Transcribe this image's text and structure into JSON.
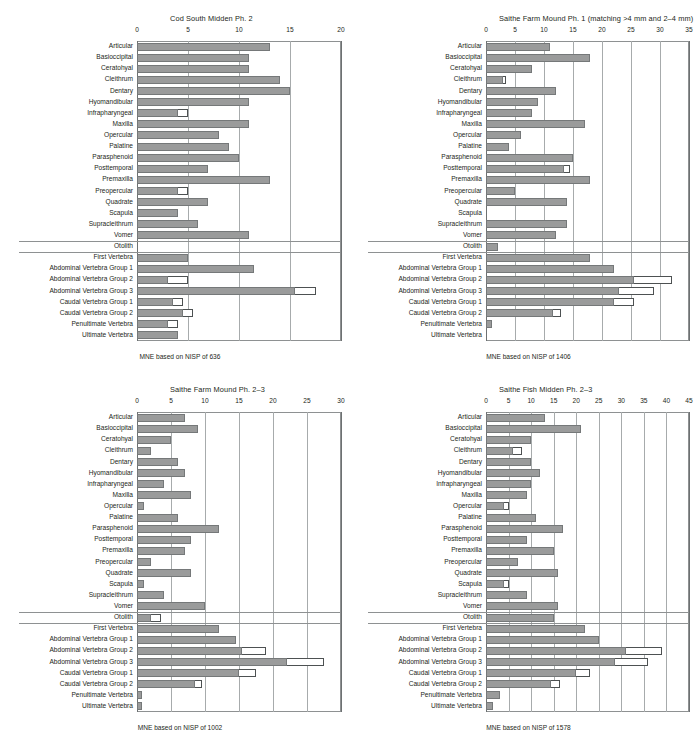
{
  "figure": {
    "rows": [
      "Articular",
      "Basioccipital",
      "Ceratohyal",
      "Cleithrum",
      "Dentary",
      "Hyomandibular",
      "Infrapharyngeal",
      "Maxilla",
      "Opercular",
      "Palatine",
      "Parasphenoid",
      "Posttemporal",
      "Premaxilla",
      "Preopercular",
      "Quadrate",
      "Scapula",
      "Supracleithrum",
      "Vomer",
      "Otolith",
      "First Vertebra",
      "Abdominal Vertebra Group 1",
      "Abdominal Vertebra Group 2",
      "Abdominal Vertebra Group 3",
      "Caudal Vertebra Group 1",
      "Caudal Vertebra Group 2",
      "Penultimate Vertebra",
      "Ultimate Vertebra"
    ],
    "colors": {
      "bar_fill": "#9a9b9b",
      "bar_stroke": "#757879",
      "overlay_fill": "#ffffff",
      "overlay_stroke": "#4d5152",
      "grid": "#a7abac",
      "frame": "#8e9192"
    },
    "separator_rows": [
      18,
      19
    ]
  },
  "chart_data": [
    {
      "type": "bar",
      "orientation": "horizontal",
      "title": "Cod South Midden Ph. 2",
      "footer": "MNE based on NISP of 636",
      "xlabel": "",
      "ylabel": "",
      "xlim": [
        0,
        20
      ],
      "xticks": [
        0,
        5,
        10,
        15,
        20
      ],
      "grid": true,
      "categories": [
        "Articular",
        "Basioccipital",
        "Ceratohyal",
        "Cleithrum",
        "Dentary",
        "Hyomandibular",
        "Infrapharyngeal",
        "Maxilla",
        "Opercular",
        "Palatine",
        "Parasphenoid",
        "Posttemporal",
        "Premaxilla",
        "Preopercular",
        "Quadrate",
        "Scapula",
        "Supracleithrum",
        "Vomer",
        "Otolith",
        "First Vertebra",
        "Abdominal Vertebra Group 1",
        "Abdominal Vertebra Group 2",
        "Abdominal Vertebra Group 3",
        "Caudal Vertebra Group 1",
        "Caudal Vertebra Group 2",
        "Penultimate Vertebra",
        "Ultimate Vertebra"
      ],
      "series": [
        {
          "name": ">4 mm",
          "values": [
            13,
            11,
            11,
            14,
            15,
            11,
            4,
            11,
            8,
            9,
            10,
            7,
            13,
            4,
            7,
            4,
            6,
            11,
            0,
            5,
            11.5,
            3,
            15.5,
            3.5,
            4.5,
            3,
            4
          ]
        },
        {
          "name": "2-4 mm total",
          "values": [
            13,
            11,
            11,
            14,
            15,
            11,
            5,
            11,
            8,
            9,
            10,
            7,
            13,
            5,
            7,
            4,
            6,
            11,
            0,
            5,
            11.5,
            5,
            17.5,
            4.5,
            5.5,
            4,
            4
          ]
        }
      ]
    },
    {
      "type": "bar",
      "orientation": "horizontal",
      "title": "Saithe Farm Mound Ph. 1 (matching >4 mm and 2–4 mm)",
      "footer": "MNE based on NISP of 1406",
      "xlabel": "",
      "ylabel": "",
      "xlim": [
        0,
        35
      ],
      "xticks": [
        0,
        5,
        10,
        15,
        20,
        25,
        30,
        35
      ],
      "grid": true,
      "categories": [
        "Articular",
        "Basioccipital",
        "Ceratohyal",
        "Cleithrum",
        "Dentary",
        "Hyomandibular",
        "Infrapharyngeal",
        "Maxilla",
        "Opercular",
        "Palatine",
        "Parasphenoid",
        "Posttemporal",
        "Premaxilla",
        "Preopercular",
        "Quadrate",
        "Scapula",
        "Supracleithrum",
        "Vomer",
        "Otolith",
        "First Vertebra",
        "Abdominal Vertebra Group 1",
        "Abdominal Vertebra Group 2",
        "Abdominal Vertebra Group 3",
        "Caudal Vertebra Group 1",
        "Caudal Vertebra Group 2",
        "Penultimate Vertebra",
        "Ultimate Vertebra"
      ],
      "series": [
        {
          "name": ">4 mm",
          "values": [
            11,
            18,
            8,
            3,
            12,
            9,
            8,
            17,
            6,
            4,
            15,
            13.5,
            18,
            5,
            14,
            0,
            14,
            12,
            2,
            18,
            22,
            25.5,
            23,
            22,
            11.5,
            1,
            0
          ]
        },
        {
          "name": "2-4 mm total",
          "values": [
            11,
            18,
            8,
            3.5,
            12,
            9,
            8,
            17,
            6,
            4,
            15,
            14.5,
            18,
            5,
            14,
            0,
            14,
            12,
            2,
            18,
            22,
            32,
            29,
            25.5,
            13,
            1,
            0
          ]
        }
      ]
    },
    {
      "type": "bar",
      "orientation": "horizontal",
      "title": "Saithe Farm Mound Ph. 2–3",
      "footer": "MNE based on NISP of 1002",
      "xlabel": "",
      "ylabel": "",
      "xlim": [
        0,
        30
      ],
      "xticks": [
        0,
        5,
        10,
        15,
        20,
        25,
        30
      ],
      "grid": true,
      "categories": [
        "Articular",
        "Basioccipital",
        "Ceratohyal",
        "Cleithrum",
        "Dentary",
        "Hyomandibular",
        "Infrapharyngeal",
        "Maxilla",
        "Opercular",
        "Palatine",
        "Parasphenoid",
        "Posttemporal",
        "Premaxilla",
        "Preopercular",
        "Quadrate",
        "Scapula",
        "Supracleithrum",
        "Vomer",
        "Otolith",
        "First Vertebra",
        "Abdominal Vertebra Group 1",
        "Abdominal Vertebra Group 2",
        "Abdominal Vertebra Group 3",
        "Caudal Vertebra Group 1",
        "Caudal Vertebra Group 2",
        "Penultimate Vertebra",
        "Ultimate Vertebra"
      ],
      "series": [
        {
          "name": ">4 mm",
          "values": [
            7,
            9,
            5,
            2,
            6,
            7,
            4,
            8,
            1,
            6,
            12,
            8,
            7,
            2,
            8,
            1,
            4,
            10,
            2,
            12,
            14.5,
            15.5,
            22,
            15,
            8.5,
            0.8,
            0.8
          ]
        },
        {
          "name": "2-4 mm total",
          "values": [
            7,
            9,
            5,
            2,
            6,
            7,
            4,
            8,
            1,
            6,
            12,
            8,
            7,
            2,
            8,
            1,
            4,
            10,
            3.5,
            12,
            14.5,
            19,
            27.5,
            17.5,
            9.5,
            0.8,
            0.8
          ]
        }
      ]
    },
    {
      "type": "bar",
      "orientation": "horizontal",
      "title": "Saithe Fish Midden Ph. 2–3",
      "footer": "MNE based on NISP of 1578",
      "xlabel": "",
      "ylabel": "",
      "xlim": [
        0,
        45
      ],
      "xticks": [
        0,
        5,
        10,
        15,
        20,
        25,
        30,
        35,
        40,
        45
      ],
      "grid": true,
      "categories": [
        "Articular",
        "Basioccipital",
        "Ceratohyal",
        "Cleithrum",
        "Dentary",
        "Hyomandibular",
        "Infrapharyngeal",
        "Maxilla",
        "Opercular",
        "Palatine",
        "Parasphenoid",
        "Posttemporal",
        "Premaxilla",
        "Preopercular",
        "Quadrate",
        "Scapula",
        "Supracleithrum",
        "Vomer",
        "Otolith",
        "First Vertebra",
        "Abdominal Vertebra Group 1",
        "Abdominal Vertebra Group 2",
        "Abdominal Vertebra Group 3",
        "Caudal Vertebra Group 1",
        "Caudal Vertebra Group 2",
        "Penultimate Vertebra",
        "Ultimate Vertebra"
      ],
      "series": [
        {
          "name": ">4 mm",
          "values": [
            13,
            21,
            10,
            6,
            10,
            12,
            10,
            9,
            4,
            11,
            17,
            9,
            15,
            7,
            16,
            4,
            9,
            16,
            15,
            22,
            25,
            31,
            28.5,
            20,
            14.5,
            3,
            1.5
          ]
        },
        {
          "name": "2-4 mm total",
          "values": [
            13,
            21,
            10,
            8,
            10,
            12,
            10,
            9,
            5,
            11,
            17,
            9,
            15,
            7,
            16,
            5,
            9,
            16,
            15,
            22,
            25,
            39,
            36,
            23,
            16.5,
            3,
            1.5
          ]
        }
      ]
    }
  ]
}
